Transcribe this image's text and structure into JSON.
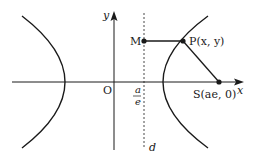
{
  "diagram": {
    "labels": {
      "y_axis": "y",
      "x_axis": "x",
      "origin": "O",
      "directrix": "d",
      "fraction_num": "a",
      "fraction_den": "e",
      "point_M": "M",
      "point_P": "P(x,  y)",
      "point_S": "S(ae, 0)"
    },
    "colors": {
      "stroke": "#1a1a1a",
      "background": "#ffffff"
    }
  }
}
